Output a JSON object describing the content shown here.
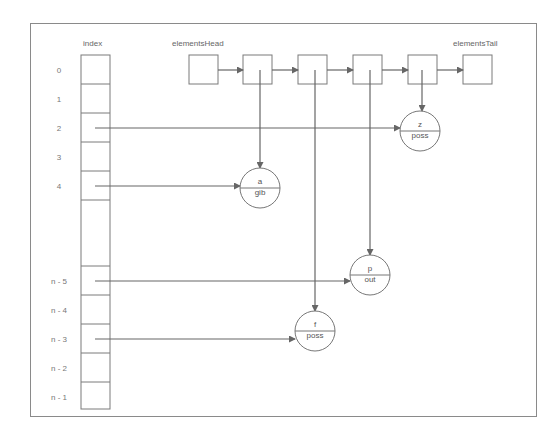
{
  "diagram": {
    "labels": {
      "index": "index",
      "head": "elementsHead",
      "tail": "elementsTail"
    },
    "index_rows": [
      {
        "label": "0",
        "y": 70
      },
      {
        "label": "1",
        "y": 99
      },
      {
        "label": "2",
        "y": 128
      },
      {
        "label": "3",
        "y": 157
      },
      {
        "label": "4",
        "y": 186
      },
      {
        "label": "",
        "y": 230
      },
      {
        "label": "n - 5",
        "y": 281
      },
      {
        "label": "n - 4",
        "y": 310
      },
      {
        "label": "n - 3",
        "y": 339
      },
      {
        "label": "n - 2",
        "y": 368
      },
      {
        "label": "n - 1",
        "y": 397
      }
    ],
    "nodes": [
      {
        "id": "z",
        "key": "z",
        "value": "poss",
        "cx": 420,
        "cy": 131
      },
      {
        "id": "a",
        "key": "a",
        "value": "gib",
        "cx": 260,
        "cy": 188
      },
      {
        "id": "p",
        "key": "p",
        "value": "out",
        "cx": 370,
        "cy": 275
      },
      {
        "id": "f",
        "key": "f",
        "value": "poss",
        "cx": 315,
        "cy": 331
      }
    ]
  }
}
